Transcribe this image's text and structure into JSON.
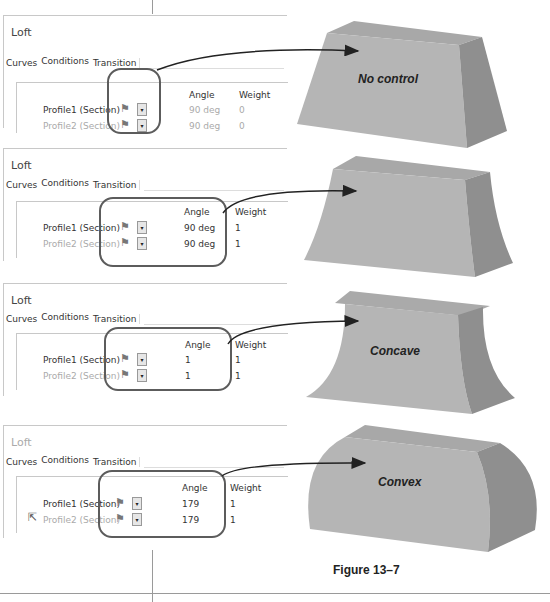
{
  "figure": {
    "caption": "Figure 13–7"
  },
  "panels": [
    {
      "title": "Loft",
      "title_dim": false,
      "tabs": [
        "Curves",
        "Conditions",
        "Transition"
      ],
      "active_tab": "Conditions",
      "columns": {
        "angle": "Angle",
        "weight": "Weight"
      },
      "rows": [
        {
          "label": "Profile1 (Section)",
          "icon": "flag-icon",
          "angle": "90 deg",
          "weight": "0",
          "dim": true
        },
        {
          "label": "Profile2 (Section)",
          "icon": "flag-icon",
          "angle": "90 deg",
          "weight": "0",
          "dim": true
        }
      ],
      "result_label": "No control"
    },
    {
      "title": "Loft",
      "title_dim": false,
      "tabs": [
        "Curves",
        "Conditions",
        "Transition"
      ],
      "active_tab": "Conditions",
      "columns": {
        "angle": "Angle",
        "weight": "Weight"
      },
      "rows": [
        {
          "label": "Profile1 (Section)",
          "icon": "flag-icon",
          "angle": "90 deg",
          "weight": "1",
          "dim": false
        },
        {
          "label": "Profile2 (Section)",
          "icon": "flag-icon",
          "angle": "90 deg",
          "weight": "1",
          "dim": false
        }
      ],
      "result_label": ""
    },
    {
      "title": "Loft",
      "title_dim": false,
      "tabs": [
        "Curves",
        "Conditions",
        "Transition"
      ],
      "active_tab": "Conditions",
      "columns": {
        "angle": "Angle",
        "weight": "Weight"
      },
      "rows": [
        {
          "label": "Profile1 (Section)",
          "icon": "flag-icon",
          "angle": "1",
          "weight": "1",
          "dim": false
        },
        {
          "label": "Profile2 (Section)",
          "icon": "flag-icon",
          "angle": "1",
          "weight": "1",
          "dim": false
        }
      ],
      "result_label": "Concave"
    },
    {
      "title": "Loft",
      "title_dim": true,
      "tabs": [
        "Curves",
        "Conditions",
        "Transition"
      ],
      "active_tab": "Conditions",
      "columns": {
        "angle": "Angle",
        "weight": "Weight"
      },
      "rows": [
        {
          "label": "Profile1 (Section)",
          "icon": "flag-icon",
          "angle": "179",
          "weight": "1",
          "dim": false
        },
        {
          "label": "Profile2 (Section)",
          "icon": "flag-icon",
          "angle": "179",
          "weight": "1",
          "dim": false
        }
      ],
      "result_label": "Convex"
    }
  ],
  "icons": {
    "flag": "⚑",
    "dropdown": "▾",
    "cursor": "⇱"
  },
  "colors": {
    "shape_front": "#b3b3b3",
    "shape_top": "#a6a6a6",
    "shape_side": "#8e8e8e",
    "annotation": "#5c5c5c",
    "arrow": "#222222"
  }
}
